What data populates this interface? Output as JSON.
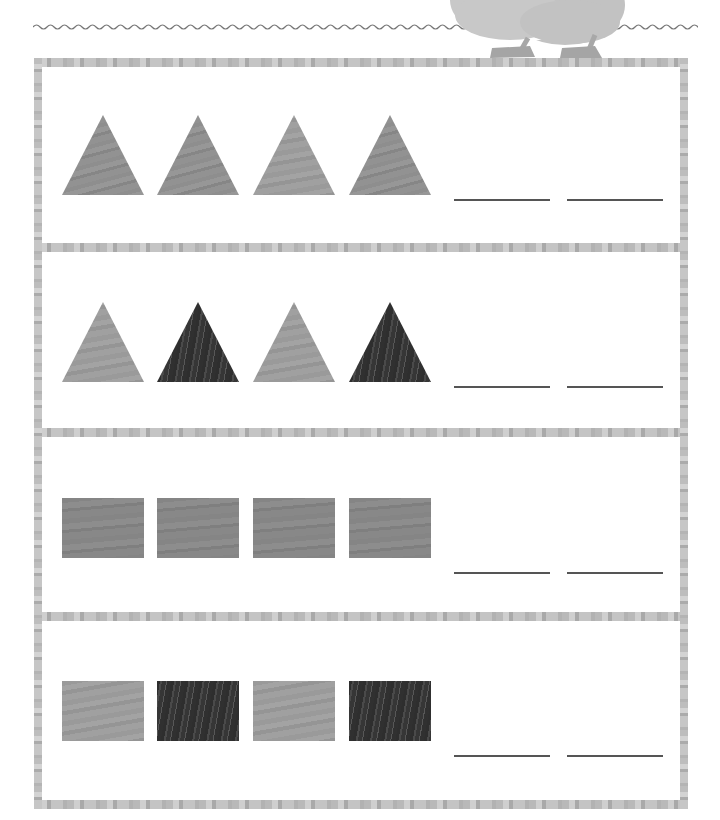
{
  "worksheet": {
    "decoration": {
      "wavy_line": "wavy-divider",
      "mascot": "bird-feet-illustration"
    },
    "rows": [
      {
        "shapes": [
          {
            "type": "triangle",
            "shade": "light"
          },
          {
            "type": "triangle",
            "shade": "light"
          },
          {
            "type": "triangle",
            "shade": "light"
          },
          {
            "type": "triangle",
            "shade": "light"
          }
        ],
        "answer_blanks": [
          "",
          ""
        ]
      },
      {
        "shapes": [
          {
            "type": "triangle",
            "shade": "light"
          },
          {
            "type": "triangle",
            "shade": "dark"
          },
          {
            "type": "triangle",
            "shade": "light"
          },
          {
            "type": "triangle",
            "shade": "dark"
          }
        ],
        "answer_blanks": [
          "",
          ""
        ]
      },
      {
        "shapes": [
          {
            "type": "rectangle",
            "shade": "light"
          },
          {
            "type": "rectangle",
            "shade": "light"
          },
          {
            "type": "rectangle",
            "shade": "light"
          },
          {
            "type": "rectangle",
            "shade": "light"
          }
        ],
        "answer_blanks": [
          "",
          ""
        ]
      },
      {
        "shapes": [
          {
            "type": "rectangle",
            "shade": "light"
          },
          {
            "type": "rectangle",
            "shade": "dark"
          },
          {
            "type": "rectangle",
            "shade": "light"
          },
          {
            "type": "rectangle",
            "shade": "dark"
          }
        ],
        "answer_blanks": [
          "",
          ""
        ]
      }
    ],
    "colors": {
      "frame": "#bdbdbd",
      "light_shape": "#8e8e8e",
      "dark_shape": "#3a3a3a",
      "blank_line": "#555555",
      "background": "#ffffff"
    }
  }
}
